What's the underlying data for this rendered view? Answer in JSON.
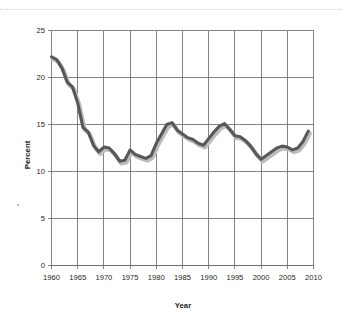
{
  "chart_data": {
    "type": "line",
    "title": "",
    "xlabel": "Year",
    "ylabel": "Percent",
    "xlim": [
      1960,
      2010
    ],
    "ylim": [
      0,
      25
    ],
    "xticks": [
      1960,
      1965,
      1970,
      1975,
      1980,
      1985,
      1990,
      1995,
      2000,
      2005,
      2010
    ],
    "yticks": [
      0,
      5,
      10,
      15,
      20,
      25
    ],
    "xtick_labels": [
      "1960",
      "1965",
      "1970",
      "1975",
      "1980",
      "1985",
      "1990",
      "1995",
      "2000",
      "2005",
      "2010"
    ],
    "ytick_labels": [
      "0",
      "5",
      "10",
      "15",
      "20",
      "25"
    ],
    "grid": true,
    "grid_color": "#6d6e71",
    "legend": "none",
    "line_color": "#58585b",
    "shadow_color": "#bcbcbf",
    "series": [
      {
        "name": "Percent",
        "x": [
          1960,
          1961,
          1962,
          1963,
          1964,
          1965,
          1966,
          1967,
          1968,
          1969,
          1970,
          1971,
          1972,
          1973,
          1974,
          1975,
          1976,
          1977,
          1978,
          1979,
          1980,
          1981,
          1982,
          1983,
          1984,
          1985,
          1986,
          1987,
          1988,
          1989,
          1990,
          1991,
          1992,
          1993,
          1994,
          1995,
          1996,
          1997,
          1998,
          1999,
          2000,
          2001,
          2002,
          2003,
          2004,
          2005,
          2006,
          2007,
          2008,
          2009
        ],
        "values": [
          22.2,
          21.9,
          21.0,
          19.5,
          19.0,
          17.3,
          14.7,
          14.2,
          12.8,
          12.1,
          12.6,
          12.5,
          11.9,
          11.1,
          11.2,
          12.3,
          11.8,
          11.6,
          11.4,
          11.7,
          13.0,
          14.0,
          15.0,
          15.2,
          14.4,
          14.0,
          13.6,
          13.4,
          13.0,
          12.8,
          13.5,
          14.2,
          14.8,
          15.1,
          14.5,
          13.8,
          13.7,
          13.3,
          12.7,
          11.9,
          11.3,
          11.7,
          12.1,
          12.5,
          12.7,
          12.6,
          12.3,
          12.5,
          13.2,
          14.3
        ]
      }
    ]
  },
  "axes": {
    "y_axis_title": "Percent",
    "x_axis_title": "Year"
  }
}
